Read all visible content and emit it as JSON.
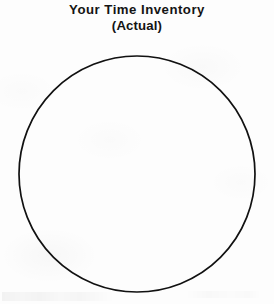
{
  "page": {
    "background_color": "#fdfdfd",
    "ink_color": "#141414",
    "width": 274,
    "height": 304
  },
  "title": {
    "line_1": "Your Time Inventory",
    "line_2": "(Actual)"
  },
  "chart_data": {
    "type": "pie",
    "title": "Your Time Inventory (Actual)",
    "subtitle": "(Actual)",
    "categories": [],
    "values": [],
    "labels": [],
    "legend": [],
    "annotations": [],
    "grid": false,
    "legend_position": "none",
    "filled": false,
    "note": "Blank worksheet pie chart: empty circle outline with no slices, labels, or data values drawn.",
    "circle": {
      "center_x": 137,
      "center_y": 174,
      "radius": 118,
      "stroke_color": "#111111",
      "stroke_width": 1.7,
      "fill": "none"
    }
  }
}
